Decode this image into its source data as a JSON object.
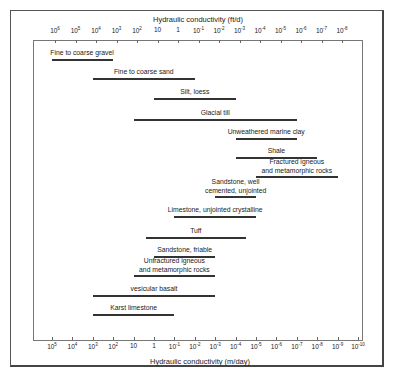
{
  "chart_data": {
    "type": "range-bar",
    "title": "",
    "top_axis": {
      "label": "Hydraulic conductivity (ft/d)",
      "ticks": [
        "10^6",
        "10^5",
        "10^4",
        "10^3",
        "10^2",
        "10",
        "1",
        "10^-1",
        "10^-2",
        "10^-3",
        "10^-4",
        "10^-5",
        "10^-6",
        "10^-7",
        "10^-8"
      ],
      "exponents": [
        6,
        5,
        4,
        3,
        2,
        1,
        0,
        -1,
        -2,
        -3,
        -4,
        -5,
        -6,
        -7,
        -8
      ]
    },
    "bottom_axis": {
      "label": "Hydraulic conductivity (m/day)",
      "ticks": [
        "10^5",
        "10^4",
        "10^3",
        "10^2",
        "10",
        "1",
        "10^-1",
        "10^-2",
        "10^-3",
        "10^-4",
        "10^-5",
        "10^-6",
        "10^-7",
        "10^-8",
        "10^-9",
        "10^-10"
      ],
      "exponents": [
        5,
        4,
        3,
        2,
        1,
        0,
        -1,
        -2,
        -3,
        -4,
        -5,
        -6,
        -7,
        -8,
        -9,
        -10
      ]
    },
    "units_of_ranges": "log10 of hydraulic conductivity in m/day",
    "series": [
      {
        "name": "Fine to coarse gravel",
        "max_exp": 5,
        "min_exp": 2
      },
      {
        "name": "Fine to coarse sand",
        "max_exp": 3,
        "min_exp": -2
      },
      {
        "name": "Silt, loess",
        "max_exp": 0,
        "min_exp": -4
      },
      {
        "name": "Glacial till",
        "max_exp": 1,
        "min_exp": -7
      },
      {
        "name": "Unweathered marine clay",
        "max_exp": -4,
        "min_exp": -7
      },
      {
        "name": "Shale",
        "max_exp": -4,
        "min_exp": -8
      },
      {
        "name": "Fractured igneous and metamorphic rocks",
        "max_exp": -5,
        "min_exp": -9
      },
      {
        "name": "Sandstone, well cemented, unjointed",
        "max_exp": -3,
        "min_exp": -5
      },
      {
        "name": "Limestone, unjointed crystalline",
        "max_exp": -1,
        "min_exp": -5
      },
      {
        "name": "Tuff",
        "max_exp": 0.4,
        "min_exp": -4.5
      },
      {
        "name": "Sandstone, friable",
        "max_exp": 0,
        "min_exp": -3
      },
      {
        "name": "Unfractured igneous and metamorphic rocks",
        "max_exp": 1,
        "min_exp": -3
      },
      {
        "name": "vesicular basalt",
        "max_exp": 3,
        "min_exp": -3
      },
      {
        "name": "Karst limestone",
        "max_exp": 3,
        "min_exp": -1
      }
    ],
    "grid": false,
    "legend": "none"
  },
  "labels": {
    "top_title": "Hydraulic conductivity (ft/d)",
    "bottom_title": "Hydraulic conductivity (m/day)",
    "top_ticks": [
      {
        "base": "10",
        "exp": "6"
      },
      {
        "base": "10",
        "exp": "5"
      },
      {
        "base": "10",
        "exp": "4"
      },
      {
        "base": "10",
        "exp": "3"
      },
      {
        "base": "10",
        "exp": "2"
      },
      {
        "base": "10",
        "exp": ""
      },
      {
        "base": "1",
        "exp": ""
      },
      {
        "base": "10",
        "exp": "-1"
      },
      {
        "base": "10",
        "exp": "-2"
      },
      {
        "base": "10",
        "exp": "-3"
      },
      {
        "base": "10",
        "exp": "-4"
      },
      {
        "base": "10",
        "exp": "-5"
      },
      {
        "base": "10",
        "exp": "-6"
      },
      {
        "base": "10",
        "exp": "-7"
      },
      {
        "base": "10",
        "exp": "-8"
      }
    ],
    "bottom_ticks": [
      {
        "base": "10",
        "exp": "5"
      },
      {
        "base": "10",
        "exp": "4"
      },
      {
        "base": "10",
        "exp": "3"
      },
      {
        "base": "10",
        "exp": "2"
      },
      {
        "base": "10",
        "exp": ""
      },
      {
        "base": "1",
        "exp": ""
      },
      {
        "base": "10",
        "exp": "-1"
      },
      {
        "base": "10",
        "exp": "-2"
      },
      {
        "base": "10",
        "exp": "-3"
      },
      {
        "base": "10",
        "exp": "-4"
      },
      {
        "base": "10",
        "exp": "-5"
      },
      {
        "base": "10",
        "exp": "-6"
      },
      {
        "base": "10",
        "exp": "-7"
      },
      {
        "base": "10",
        "exp": "-8"
      },
      {
        "base": "10",
        "exp": "-9"
      },
      {
        "base": "10",
        "exp": "-10"
      }
    ],
    "bars": [
      {
        "line1": "Fine to coarse gravel",
        "line2": ""
      },
      {
        "line1": "Fine to coarse sand",
        "line2": ""
      },
      {
        "line1": "Silt, loess",
        "line2": ""
      },
      {
        "line1": "Glacial till",
        "line2": ""
      },
      {
        "line1": "Unweathered marine clay",
        "line2": ""
      },
      {
        "line1": "Shale",
        "line2": ""
      },
      {
        "line1": "Fractured igneous",
        "line2": "and metamorphic rocks"
      },
      {
        "line1": "Sandstone, well",
        "line2": "cemented, unjointed"
      },
      {
        "line1": "Limestone, unjointed crystalline",
        "line2": ""
      },
      {
        "line1": "Tuff",
        "line2": ""
      },
      {
        "line1": "Sandstone, friable",
        "line2": ""
      },
      {
        "line1": "Unfractured igneous",
        "line2": "and metamorphic rocks"
      },
      {
        "line1": "vesicular basalt",
        "line2": ""
      },
      {
        "line1": "Karst limestone",
        "line2": ""
      }
    ]
  }
}
